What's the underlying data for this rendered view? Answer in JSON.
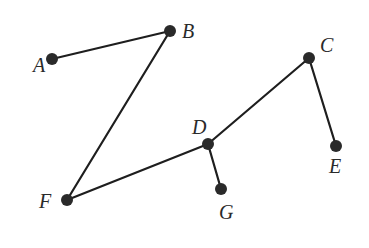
{
  "diagram": {
    "type": "graph",
    "width": 369,
    "height": 248,
    "colors": {
      "edge": "#1e1e1e",
      "node": "#2a2a2a",
      "label": "#2a2a2a",
      "background": "#ffffff"
    },
    "nodes": [
      {
        "id": "A",
        "label": "A",
        "x": 52,
        "y": 59,
        "lx": 33,
        "ly": 72
      },
      {
        "id": "B",
        "label": "B",
        "x": 170,
        "y": 31,
        "lx": 182,
        "ly": 38
      },
      {
        "id": "C",
        "label": "C",
        "x": 309,
        "y": 58,
        "lx": 320,
        "ly": 52
      },
      {
        "id": "D",
        "label": "D",
        "x": 208,
        "y": 144,
        "lx": 192,
        "ly": 134
      },
      {
        "id": "E",
        "label": "E",
        "x": 336,
        "y": 146,
        "lx": 329,
        "ly": 173
      },
      {
        "id": "F",
        "label": "F",
        "x": 67,
        "y": 200,
        "lx": 39,
        "ly": 208
      },
      {
        "id": "G",
        "label": "G",
        "x": 221,
        "y": 189,
        "lx": 219,
        "ly": 219
      }
    ],
    "edges": [
      {
        "from": "A",
        "to": "B"
      },
      {
        "from": "B",
        "to": "F"
      },
      {
        "from": "F",
        "to": "D"
      },
      {
        "from": "D",
        "to": "C"
      },
      {
        "from": "C",
        "to": "E"
      },
      {
        "from": "D",
        "to": "G"
      }
    ]
  }
}
